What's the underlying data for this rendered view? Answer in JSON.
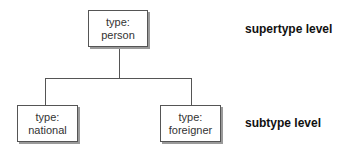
{
  "diagram": {
    "nodes": [
      {
        "id": "person",
        "line1": "type:",
        "line2": "person"
      },
      {
        "id": "national",
        "line1": "type:",
        "line2": "national"
      },
      {
        "id": "foreigner",
        "line1": "type:",
        "line2": "foreigner"
      }
    ],
    "edges": [
      {
        "from": "person",
        "to": "national"
      },
      {
        "from": "person",
        "to": "foreigner"
      }
    ],
    "levels": {
      "supertype": "supertype level",
      "subtype": "subtype level"
    }
  }
}
